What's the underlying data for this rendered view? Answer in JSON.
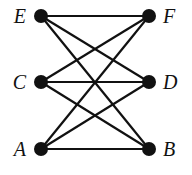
{
  "diagram": {
    "type": "graph",
    "nodes": [
      {
        "id": "E",
        "label": "E",
        "x": 41,
        "y": 16,
        "label_x": 26,
        "label_y": 23,
        "anchor": "end"
      },
      {
        "id": "F",
        "label": "F",
        "x": 149,
        "y": 16,
        "label_x": 163,
        "label_y": 23,
        "anchor": "start"
      },
      {
        "id": "C",
        "label": "C",
        "x": 41,
        "y": 82,
        "label_x": 26,
        "label_y": 89,
        "anchor": "end"
      },
      {
        "id": "D",
        "label": "D",
        "x": 149,
        "y": 82,
        "label_x": 163,
        "label_y": 89,
        "anchor": "start"
      },
      {
        "id": "A",
        "label": "A",
        "x": 41,
        "y": 149,
        "label_x": 26,
        "label_y": 156,
        "anchor": "end"
      },
      {
        "id": "B",
        "label": "B",
        "x": 149,
        "y": 149,
        "label_x": 163,
        "label_y": 156,
        "anchor": "start"
      }
    ],
    "edges": [
      [
        "E",
        "F"
      ],
      [
        "E",
        "D"
      ],
      [
        "E",
        "B"
      ],
      [
        "C",
        "F"
      ],
      [
        "C",
        "D"
      ],
      [
        "C",
        "B"
      ],
      [
        "A",
        "F"
      ],
      [
        "A",
        "D"
      ],
      [
        "A",
        "B"
      ]
    ]
  }
}
